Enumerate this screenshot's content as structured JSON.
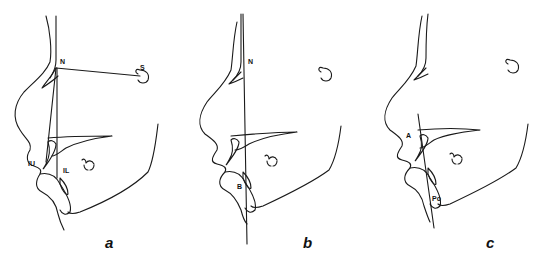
{
  "figure": {
    "panels": [
      {
        "id": "a",
        "caption": "a",
        "labels": {
          "n": "N",
          "s": "S",
          "iu": "IU",
          "il": "IL"
        },
        "description": "Lateral cephalometric profile tracing with S-N line and lines from N to upper (IU) and lower (IL) incisors"
      },
      {
        "id": "b",
        "caption": "b",
        "labels": {
          "n": "N",
          "b": "B"
        },
        "description": "Profile tracing with vertical line from N through point B"
      },
      {
        "id": "c",
        "caption": "c",
        "labels": {
          "a": "A",
          "po": "Po"
        },
        "description": "Profile tracing with line from point A to Pogonion (Po)"
      }
    ],
    "colors": {
      "stroke": "#1a1a1a",
      "background": "#ffffff"
    }
  }
}
